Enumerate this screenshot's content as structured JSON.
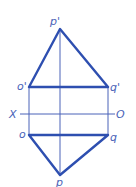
{
  "diagram": {
    "type": "orthographic projection of triangle",
    "colors": {
      "thick": "#2e4fb0",
      "thin": "#4a63b8"
    },
    "labels": {
      "p_prime": "p'",
      "o_prime": "o'",
      "q_prime": "q'",
      "x_axis": "X",
      "o_axis": "O",
      "o": "o",
      "q": "q",
      "p": "p"
    }
  }
}
